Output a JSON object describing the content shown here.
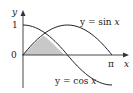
{
  "diagram": {
    "curves": [
      {
        "name": "sine",
        "label_lhs": "y = sin ",
        "label_var": "x"
      },
      {
        "name": "cosine",
        "label_lhs": "y = cos ",
        "label_var": "x"
      }
    ],
    "axes": {
      "x_label": "x",
      "y_label": "y",
      "ticks": {
        "y_one": "1",
        "origin": "0",
        "x_pi": "π"
      }
    },
    "shaded_region": {
      "description": "region under min(sin x, cos x) from 0 to π/2",
      "color": "#c8c8c8"
    },
    "colors": {
      "curve": "#222222",
      "axis": "#333333",
      "fill": "#c8c8c8"
    }
  }
}
